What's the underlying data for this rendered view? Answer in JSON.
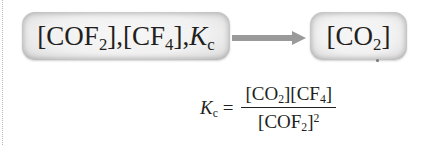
{
  "diagram": {
    "input_box": {
      "species": [
        {
          "symbol": "COF",
          "subscript": "2"
        },
        {
          "symbol": "CF",
          "subscript": "4"
        }
      ],
      "constant": {
        "symbol": "K",
        "subscript": "c"
      },
      "separator": ", "
    },
    "arrow": {
      "direction": "right",
      "color": "#9a9a9a"
    },
    "output_box": {
      "species": {
        "symbol": "CO",
        "subscript": "2"
      }
    },
    "equation": {
      "lhs": {
        "symbol": "K",
        "subscript": "c"
      },
      "equals": "=",
      "numerator": [
        {
          "symbol": "CO",
          "subscript": "2"
        },
        {
          "symbol": "CF",
          "subscript": "4"
        }
      ],
      "denominator": {
        "symbol": "COF",
        "subscript": "2",
        "power": "2"
      }
    },
    "colors": {
      "box_fill": "#f1f1f1",
      "box_edge": "#cfcfcf",
      "text": "#231f20"
    }
  }
}
